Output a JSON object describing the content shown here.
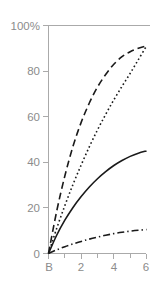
{
  "chart_data": {
    "type": "line",
    "title": "",
    "subtitle": "",
    "xlabel": "",
    "ylabel": "",
    "xlim": [
      0,
      6.4
    ],
    "ylim": [
      0,
      100
    ],
    "grid": "horizontal-line-at-100-only",
    "legend": "none",
    "x_tick_labels": [
      "B",
      "2",
      "4",
      "6"
    ],
    "x_tick_values": [
      0,
      2,
      4,
      6
    ],
    "x_minor_tick_values": [
      1,
      3,
      5
    ],
    "y_tick_labels": [
      "0",
      "20",
      "40",
      "60",
      "80",
      "100%"
    ],
    "y_tick_values": [
      0,
      20,
      40,
      60,
      80,
      100
    ],
    "y_axis_top_label": "100%",
    "x": [
      0,
      0.5,
      1,
      1.5,
      2,
      2.5,
      3,
      3.5,
      4,
      4.5,
      5,
      5.5,
      6
    ],
    "series": [
      {
        "name": "curve-dashed",
        "style": "dashed",
        "color": "#1a1a1a",
        "endpoint": 91,
        "values": [
          0,
          18.5,
          34.0,
          47.0,
          57.5,
          66.0,
          73.0,
          78.5,
          83.0,
          86.3,
          88.5,
          90.0,
          91.0
        ]
      },
      {
        "name": "curve-dotted",
        "style": "dotted",
        "color": "#1a1a1a",
        "endpoint": 91,
        "values": [
          0,
          11.0,
          21.0,
          30.3,
          38.8,
          46.8,
          54.2,
          61.0,
          67.4,
          73.3,
          79.0,
          85.0,
          91.0
        ]
      },
      {
        "name": "curve-solid",
        "style": "solid",
        "color": "#1a1a1a",
        "endpoint": 45,
        "values": [
          0,
          8.0,
          14.6,
          20.2,
          25.0,
          29.2,
          32.8,
          35.9,
          38.6,
          40.8,
          42.6,
          44.0,
          45.0
        ]
      },
      {
        "name": "curve-dashdot",
        "style": "dashdot",
        "color": "#1a1a1a",
        "endpoint": 10.5,
        "values": [
          0,
          1.6,
          3.0,
          4.2,
          5.3,
          6.3,
          7.2,
          8.0,
          8.7,
          9.3,
          9.8,
          10.2,
          10.5
        ]
      }
    ],
    "annotations": []
  },
  "axes": {
    "y_labels": [
      {
        "text": "100%",
        "value": 100
      },
      {
        "text": "80",
        "value": 80
      },
      {
        "text": "60",
        "value": 60
      },
      {
        "text": "40",
        "value": 40
      },
      {
        "text": "20",
        "value": 20
      },
      {
        "text": "0",
        "value": 0
      }
    ],
    "x_labels": [
      {
        "text": "B",
        "value": 0
      },
      {
        "text": "2",
        "value": 2
      },
      {
        "text": "4",
        "value": 4
      },
      {
        "text": "6",
        "value": 6
      }
    ]
  },
  "colors": {
    "axis": "#aaaaaa",
    "tick_text": "#8c8c8c",
    "curve": "#1a1a1a",
    "background": "#ffffff"
  }
}
